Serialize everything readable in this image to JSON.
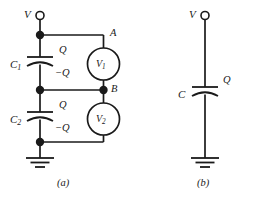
{
  "figure": {
    "background_color": "#ffffff",
    "ink_color": "#1a1a1a",
    "panels": [
      {
        "id": "a",
        "caption": "(a)",
        "description": "two capacitors in series with two voltmeters",
        "terminal_label": "V",
        "components": [
          {
            "name": "capacitor-c1",
            "label": "C",
            "subscript": "1",
            "top_charge": "Q",
            "bottom_charge": "−Q"
          },
          {
            "name": "capacitor-c2",
            "label": "C",
            "subscript": "2",
            "top_charge": "Q",
            "bottom_charge": "−Q"
          },
          {
            "name": "voltmeter-v1",
            "label": "V",
            "subscript": "1"
          },
          {
            "name": "voltmeter-v2",
            "label": "V",
            "subscript": "2"
          }
        ],
        "nodes": [
          {
            "name": "node-a",
            "label": "A"
          },
          {
            "name": "node-b",
            "label": "B"
          }
        ],
        "ground": "ground-symbol"
      },
      {
        "id": "b",
        "caption": "(b)",
        "description": "single equivalent capacitor",
        "terminal_label": "V",
        "components": [
          {
            "name": "capacitor-c",
            "label": "C",
            "subscript": "",
            "top_charge": "Q",
            "bottom_charge": ""
          }
        ],
        "nodes": [],
        "ground": "ground-symbol"
      }
    ],
    "labels": {
      "panel_a_terminal_v": "V",
      "panel_a_c1": "C",
      "panel_a_c1_sub": "1",
      "panel_a_c2": "C",
      "panel_a_c2_sub": "2",
      "panel_a_q1_top": "Q",
      "panel_a_q1_bottom": "−Q",
      "panel_a_q2_top": "Q",
      "panel_a_q2_bottom": "−Q",
      "panel_a_node_a": "A",
      "panel_a_node_b": "B",
      "panel_a_v1": "V",
      "panel_a_v1_sub": "1",
      "panel_a_v2": "V",
      "panel_a_v2_sub": "2",
      "panel_a_caption": "(a)",
      "panel_b_terminal_v": "V",
      "panel_b_c": "C",
      "panel_b_q": "Q",
      "panel_b_caption": "(b)"
    }
  }
}
